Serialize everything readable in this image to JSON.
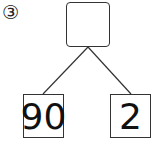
{
  "problem_label": "③",
  "top_box": {
    "value": ""
  },
  "left_box": {
    "value": "90"
  },
  "right_box": {
    "value": "2"
  }
}
